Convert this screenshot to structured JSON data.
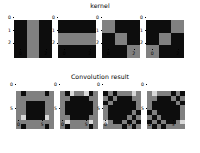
{
  "figure": {
    "background_color": "#ffffff",
    "width": 200,
    "height": 153
  },
  "colors": {
    "dark": "#0d0d0d",
    "mid_gray": "#808080",
    "light": "#d9d9d9"
  },
  "sections": [
    {
      "id": "kernel-section",
      "title": "kernel"
    },
    {
      "id": "convolution-section",
      "title": "Convolution result"
    }
  ],
  "chart_data": [
    {
      "type": "heatmap",
      "title": "kernel",
      "panel_index": 0,
      "name": "kernel-vertical-bars",
      "xlabel": "",
      "ylabel": "",
      "xticks": [
        "0",
        "2"
      ],
      "yticks": [
        "0",
        "1",
        "2"
      ],
      "xtick_values": [
        0,
        2
      ],
      "ytick_values": [
        0,
        1,
        2
      ],
      "cmap": "gray",
      "values": [
        [
          0,
          1,
          0
        ],
        [
          0,
          1,
          0
        ],
        [
          0,
          1,
          0
        ]
      ]
    },
    {
      "type": "heatmap",
      "title": "kernel",
      "panel_index": 1,
      "name": "kernel-horizontal-bars",
      "xlabel": "",
      "ylabel": "",
      "xticks": [
        "0",
        "2"
      ],
      "yticks": [
        "0",
        "1",
        "2"
      ],
      "xtick_values": [
        0,
        2
      ],
      "ytick_values": [
        0,
        1,
        2
      ],
      "cmap": "gray",
      "values": [
        [
          0,
          0,
          0
        ],
        [
          1,
          1,
          1
        ],
        [
          0,
          0,
          0
        ]
      ]
    },
    {
      "type": "heatmap",
      "title": "kernel",
      "panel_index": 2,
      "name": "kernel-main-diagonal",
      "xlabel": "",
      "ylabel": "",
      "xticks": [
        "0",
        "2"
      ],
      "yticks": [
        "0",
        "1",
        "2"
      ],
      "xtick_values": [
        0,
        2
      ],
      "ytick_values": [
        0,
        1,
        2
      ],
      "cmap": "gray",
      "values": [
        [
          1,
          0,
          0
        ],
        [
          0,
          1,
          0
        ],
        [
          0,
          0,
          1
        ]
      ]
    },
    {
      "type": "heatmap",
      "title": "kernel",
      "panel_index": 3,
      "name": "kernel-anti-diagonal",
      "xlabel": "",
      "ylabel": "",
      "xticks": [
        "0",
        "2"
      ],
      "yticks": [
        "0",
        "1",
        "2"
      ],
      "xtick_values": [
        0,
        2
      ],
      "ytick_values": [
        0,
        1,
        2
      ],
      "cmap": "gray",
      "values": [
        [
          0,
          0,
          1
        ],
        [
          0,
          1,
          0
        ],
        [
          1,
          0,
          0
        ]
      ]
    },
    {
      "type": "heatmap",
      "title": "Convolution result",
      "panel_index": 0,
      "name": "convolution-result-vertical",
      "xlabel": "",
      "ylabel": "",
      "xticks": [
        "0",
        "5"
      ],
      "yticks": [
        "0",
        "5"
      ],
      "xtick_values": [
        0,
        5
      ],
      "ytick_values": [
        0,
        5
      ],
      "cmap": "gray",
      "values": [
        [
          1,
          0,
          1,
          1,
          1,
          1,
          0,
          1
        ],
        [
          1,
          1,
          1,
          1,
          1,
          1,
          1,
          1
        ],
        [
          1,
          1,
          0,
          0,
          0,
          0,
          1,
          1
        ],
        [
          1,
          1,
          0,
          0,
          0,
          0,
          1,
          1
        ],
        [
          1,
          1,
          0,
          0,
          0,
          0,
          1,
          1
        ],
        [
          1,
          2,
          0,
          0,
          0,
          0,
          2,
          1
        ],
        [
          1,
          1,
          1,
          1,
          1,
          1,
          1,
          1
        ],
        [
          1,
          0,
          1,
          1,
          1,
          1,
          0,
          1
        ]
      ]
    },
    {
      "type": "heatmap",
      "title": "Convolution result",
      "panel_index": 1,
      "name": "convolution-result-horizontal",
      "xlabel": "",
      "ylabel": "",
      "xticks": [
        "0",
        "5"
      ],
      "yticks": [
        "0",
        "5"
      ],
      "xtick_values": [
        0,
        5
      ],
      "ytick_values": [
        0,
        5
      ],
      "cmap": "gray",
      "values": [
        [
          1,
          0,
          2,
          1,
          1,
          2,
          0,
          1
        ],
        [
          1,
          1,
          0,
          0,
          0,
          0,
          1,
          1
        ],
        [
          1,
          0,
          0,
          0,
          0,
          0,
          0,
          1
        ],
        [
          1,
          0,
          0,
          0,
          0,
          0,
          0,
          1
        ],
        [
          1,
          0,
          0,
          0,
          0,
          0,
          0,
          1
        ],
        [
          1,
          1,
          0,
          0,
          0,
          0,
          1,
          1
        ],
        [
          1,
          2,
          1,
          1,
          1,
          1,
          2,
          1
        ],
        [
          1,
          0,
          1,
          1,
          1,
          1,
          0,
          1
        ]
      ]
    },
    {
      "type": "heatmap",
      "title": "Convolution result",
      "panel_index": 2,
      "name": "convolution-result-main-diagonal",
      "xlabel": "",
      "ylabel": "",
      "xticks": [
        "0",
        "5"
      ],
      "yticks": [
        "0",
        "5"
      ],
      "xtick_values": [
        0,
        5
      ],
      "ytick_values": [
        0,
        5
      ],
      "cmap": "gray",
      "values": [
        [
          0,
          1,
          0,
          1,
          1,
          1,
          2,
          1
        ],
        [
          1,
          0,
          1,
          0,
          0,
          0,
          1,
          1
        ],
        [
          0,
          1,
          0,
          0,
          0,
          0,
          0,
          1
        ],
        [
          1,
          0,
          0,
          0,
          0,
          0,
          0,
          1
        ],
        [
          1,
          0,
          0,
          0,
          0,
          0,
          1,
          0
        ],
        [
          1,
          0,
          0,
          0,
          0,
          1,
          0,
          1
        ],
        [
          2,
          1,
          0,
          0,
          1,
          0,
          1,
          0
        ],
        [
          1,
          1,
          1,
          1,
          0,
          1,
          0,
          1
        ]
      ]
    },
    {
      "type": "heatmap",
      "title": "Convolution result",
      "panel_index": 3,
      "name": "convolution-result-anti-diagonal",
      "xlabel": "",
      "ylabel": "",
      "xticks": [
        "0",
        "5"
      ],
      "yticks": [
        "0",
        "5"
      ],
      "xtick_values": [
        0,
        5
      ],
      "ytick_values": [
        0,
        5
      ],
      "cmap": "gray",
      "values": [
        [
          1,
          2,
          1,
          1,
          1,
          0,
          1,
          0
        ],
        [
          1,
          1,
          0,
          0,
          0,
          1,
          0,
          1
        ],
        [
          1,
          0,
          0,
          0,
          0,
          0,
          1,
          0
        ],
        [
          1,
          0,
          0,
          0,
          0,
          0,
          0,
          1
        ],
        [
          0,
          1,
          0,
          0,
          0,
          0,
          0,
          1
        ],
        [
          1,
          0,
          1,
          0,
          0,
          0,
          0,
          1
        ],
        [
          0,
          1,
          0,
          1,
          0,
          0,
          1,
          2
        ],
        [
          1,
          0,
          1,
          0,
          1,
          1,
          1,
          1
        ]
      ]
    }
  ]
}
